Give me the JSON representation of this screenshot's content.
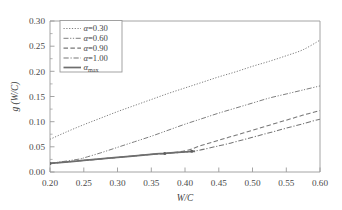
{
  "chart_data": {
    "type": "line",
    "title": "",
    "xlabel": "W/C",
    "ylabel": "g (W/C)",
    "xlim": [
      0.2,
      0.6
    ],
    "ylim": [
      0.0,
      0.3
    ],
    "xticks": [
      "0.20",
      "0.25",
      "0.30",
      "0.35",
      "0.40",
      "0.45",
      "0.50",
      "0.55",
      "0.60"
    ],
    "yticks": [
      "0.00",
      "0.05",
      "0.10",
      "0.15",
      "0.20",
      "0.25",
      "0.30"
    ],
    "xtick_values": [
      0.2,
      0.25,
      0.3,
      0.35,
      0.4,
      0.45,
      0.5,
      0.55,
      0.6
    ],
    "ytick_values": [
      0.0,
      0.05,
      0.1,
      0.15,
      0.2,
      0.25,
      0.3
    ],
    "grid": false,
    "legend_position": "upper-left-inside",
    "series": [
      {
        "name": "a=0.30",
        "label_symbol": "α",
        "label_rest": "=0.30",
        "style": "dotted",
        "color": "#777777",
        "x": [
          0.2,
          0.225,
          0.25,
          0.275,
          0.3,
          0.325,
          0.35,
          0.375,
          0.4,
          0.425,
          0.45,
          0.475,
          0.5,
          0.525,
          0.55,
          0.575,
          0.6
        ],
        "values": [
          0.065,
          0.08,
          0.094,
          0.107,
          0.12,
          0.132,
          0.144,
          0.156,
          0.167,
          0.178,
          0.189,
          0.199,
          0.21,
          0.22,
          0.231,
          0.243,
          0.262
        ]
      },
      {
        "name": "a=0.60",
        "label_symbol": "α",
        "label_rest": "=0.60",
        "style": "dash-dot-dot",
        "color": "#777777",
        "x": [
          0.2,
          0.245,
          0.25,
          0.275,
          0.3,
          0.325,
          0.35,
          0.375,
          0.4,
          0.425,
          0.45,
          0.475,
          0.5,
          0.525,
          0.55,
          0.575,
          0.6
        ],
        "values": [
          0.017,
          0.026,
          0.028,
          0.038,
          0.049,
          0.06,
          0.071,
          0.083,
          0.095,
          0.106,
          0.117,
          0.127,
          0.137,
          0.147,
          0.155,
          0.163,
          0.171
        ],
        "branch_x": 0.245,
        "branch_note": "coincides with alpha_max below W/C=0.245"
      },
      {
        "name": "a=0.90",
        "label_symbol": "α",
        "label_rest": "=0.90",
        "style": "dashed",
        "color": "#777777",
        "x": [
          0.2,
          0.25,
          0.3,
          0.35,
          0.37,
          0.4,
          0.425,
          0.45,
          0.475,
          0.5,
          0.525,
          0.55,
          0.575,
          0.6
        ],
        "values": [
          0.017,
          0.023,
          0.029,
          0.035,
          0.037,
          0.042,
          0.053,
          0.063,
          0.073,
          0.083,
          0.093,
          0.103,
          0.113,
          0.122
        ],
        "branch_x": 0.37,
        "branch_note": "coincides with alpha_max below W/C=0.37"
      },
      {
        "name": "a=1.00",
        "label_symbol": "α",
        "label_rest": "=1.00",
        "style": "dash-dot",
        "color": "#777777",
        "x": [
          0.2,
          0.25,
          0.3,
          0.35,
          0.41,
          0.45,
          0.475,
          0.5,
          0.525,
          0.55,
          0.575,
          0.6
        ],
        "values": [
          0.017,
          0.023,
          0.029,
          0.035,
          0.041,
          0.052,
          0.06,
          0.069,
          0.078,
          0.087,
          0.096,
          0.105
        ],
        "branch_x": 0.41,
        "branch_note": "coincides with alpha_max below W/C=0.41"
      },
      {
        "name": "a_max",
        "label_symbol": "α",
        "label_rest": "",
        "label_subscript": "max",
        "style": "solid",
        "color": "#6e6e6e",
        "x": [
          0.2,
          0.25,
          0.3,
          0.35,
          0.37,
          0.4,
          0.41,
          0.415
        ],
        "values": [
          0.017,
          0.023,
          0.029,
          0.035,
          0.037,
          0.04,
          0.041,
          0.041
        ]
      }
    ],
    "marker_points": [
      {
        "x": 0.2,
        "y": 0.017,
        "note": "common start marker"
      },
      {
        "x": 0.37,
        "y": 0.037,
        "note": "alpha=0.90 branch marker"
      },
      {
        "x": 0.41,
        "y": 0.041,
        "note": "alpha=1.00 branch marker"
      }
    ]
  },
  "axes": {
    "x_axis_title": "W/C",
    "y_axis_title": "g (W/C)"
  },
  "legend": {
    "entries": [
      {
        "label": "α=0.30",
        "style": "dotted"
      },
      {
        "label": "α=0.60",
        "style": "dash-dot-dot"
      },
      {
        "label": "α=0.90",
        "style": "dashed"
      },
      {
        "label": "α=1.00",
        "style": "dash-dot"
      },
      {
        "label": "αmax",
        "style": "solid"
      }
    ]
  },
  "colors": {
    "frame": "#9a9a9a",
    "curve": "#777777",
    "text": "#3f3f3f",
    "background": "#ffffff"
  }
}
